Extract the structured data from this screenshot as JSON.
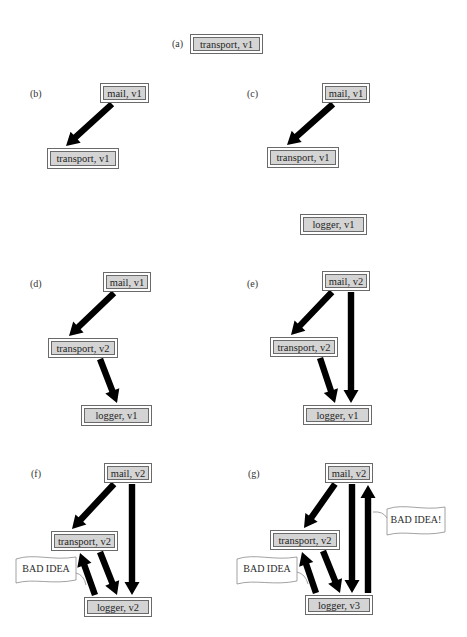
{
  "figure": {
    "panels": [
      {
        "id": "a",
        "label": "(a)",
        "label_pos": [
          172,
          38
        ],
        "nodes": [
          {
            "id": "transport",
            "text": "transport, v1",
            "box": [
              190,
              34,
              73,
              20
            ]
          }
        ],
        "edges": [],
        "flags": []
      },
      {
        "id": "b",
        "label": "(b)",
        "label_pos": [
          30,
          88
        ],
        "nodes": [
          {
            "id": "mail",
            "text": "mail, v1",
            "box": [
              100,
              83,
              49,
              20
            ]
          },
          {
            "id": "transport",
            "text": "transport, v1",
            "box": [
              47,
              148,
              72,
              21
            ]
          }
        ],
        "edges": [
          {
            "from": "mail",
            "to": "transport",
            "line": [
              112,
              104,
              66,
              146
            ]
          }
        ],
        "flags": []
      },
      {
        "id": "c",
        "label": "(c)",
        "label_pos": [
          247,
          88
        ],
        "nodes": [
          {
            "id": "mail",
            "text": "mail, v1",
            "box": [
              322,
              83,
              48,
              20
            ]
          },
          {
            "id": "transport",
            "text": "transport, v1",
            "box": [
              267,
              147,
              72,
              21
            ]
          },
          {
            "id": "logger",
            "text": "logger, v1",
            "box": [
              300,
              214,
              67,
              21
            ]
          }
        ],
        "edges": [
          {
            "from": "mail",
            "to": "transport",
            "line": [
              333,
              104,
              287,
              145
            ]
          }
        ],
        "flags": []
      },
      {
        "id": "d",
        "label": "(d)",
        "label_pos": [
          30,
          278
        ],
        "nodes": [
          {
            "id": "mail",
            "text": "mail, v1",
            "box": [
              103,
              272,
              48,
              20
            ]
          },
          {
            "id": "transport",
            "text": "transport, v2",
            "box": [
              48,
              338,
              70,
              20
            ]
          },
          {
            "id": "logger",
            "text": "logger, v1",
            "box": [
              81,
              405,
              71,
              21
            ]
          }
        ],
        "edges": [
          {
            "from": "mail",
            "to": "transport",
            "line": [
              114,
              293,
              69,
              336
            ]
          },
          {
            "from": "transport",
            "to": "logger",
            "line": [
              100,
              359,
              117,
              403
            ]
          }
        ],
        "flags": []
      },
      {
        "id": "e",
        "label": "(e)",
        "label_pos": [
          247,
          278
        ],
        "nodes": [
          {
            "id": "mail",
            "text": "mail, v2",
            "box": [
              322,
              271,
              48,
              20
            ]
          },
          {
            "id": "transport",
            "text": "transport, v2",
            "box": [
              270,
              337,
              68,
              20
            ]
          },
          {
            "id": "logger",
            "text": "logger, v1",
            "box": [
              303,
              405,
              69,
              20
            ]
          }
        ],
        "edges": [
          {
            "from": "mail",
            "to": "transport",
            "line": [
              332,
              292,
              291,
              335
            ]
          },
          {
            "from": "transport",
            "to": "logger",
            "line": [
              320,
              358,
              335,
              403
            ]
          },
          {
            "from": "mail",
            "to": "logger",
            "line": [
              351,
              292,
              351,
              403
            ]
          }
        ],
        "flags": []
      },
      {
        "id": "f",
        "label": "(f)",
        "label_pos": [
          31,
          468
        ],
        "nodes": [
          {
            "id": "mail",
            "text": "mail, v2",
            "box": [
              104,
              463,
              48,
              20
            ]
          },
          {
            "id": "transport",
            "text": "transport, v2",
            "box": [
              51,
              531,
              67,
              20
            ]
          },
          {
            "id": "logger",
            "text": "logger, v2",
            "box": [
              84,
              597,
              68,
              20
            ]
          }
        ],
        "edges": [
          {
            "from": "mail",
            "to": "transport",
            "line": [
              114,
              484,
              72,
              529
            ]
          },
          {
            "from": "transport",
            "to": "logger",
            "line": [
              100,
              552,
              117,
              595
            ]
          },
          {
            "from": "mail",
            "to": "logger",
            "line": [
              132,
              484,
              132,
              595
            ]
          },
          {
            "from": "logger",
            "to": "transport",
            "line": [
              95,
              595,
              80,
              553
            ]
          }
        ],
        "flags": [
          {
            "text": "BAD IDEA",
            "box": [
              16,
              556,
              60,
              27
            ],
            "tail": [
              76,
              573,
              86,
              585
            ]
          }
        ]
      },
      {
        "id": "g",
        "label": "(g)",
        "label_pos": [
          248,
          468
        ],
        "nodes": [
          {
            "id": "mail",
            "text": "mail, v2",
            "box": [
              325,
              463,
              48,
              20
            ]
          },
          {
            "id": "transport",
            "text": "transport, v2",
            "box": [
              270,
              530,
              70,
              20
            ]
          },
          {
            "id": "logger",
            "text": "logger, v3",
            "box": [
              305,
              595,
              68,
              20
            ]
          }
        ],
        "edges": [
          {
            "from": "mail",
            "to": "transport",
            "line": [
              335,
              484,
              304,
              528
            ]
          },
          {
            "from": "transport",
            "to": "logger",
            "line": [
              323,
              551,
              340,
              593
            ]
          },
          {
            "from": "mail",
            "to": "logger",
            "line": [
              352,
              484,
              352,
              593
            ]
          },
          {
            "from": "logger",
            "to": "transport",
            "line": [
              316,
              593,
              302,
              552
            ]
          },
          {
            "from": "logger",
            "to": "mail",
            "line": [
              368,
              593,
              368,
              485
            ]
          }
        ],
        "flags": [
          {
            "text": "BAD IDEA",
            "box": [
              237,
              556,
              60,
              28
            ],
            "tail": [
              297,
              572,
              308,
              584
            ]
          },
          {
            "text": "BAD IDEA!",
            "box": [
              387,
              506,
              58,
              29
            ],
            "tail": [
              387,
              518,
              373,
              512
            ]
          }
        ]
      }
    ]
  },
  "colors": {
    "node_fill": "#d4d4d4",
    "node_border": "#6a6a6a",
    "arrow": "#000000",
    "flag_fill": "#ffffff",
    "flag_border": "#8a8a8a"
  }
}
